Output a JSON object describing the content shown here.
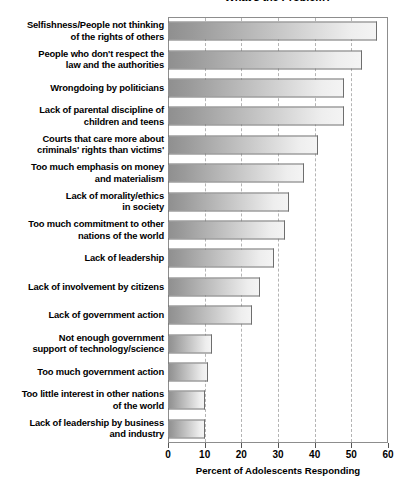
{
  "chart_data": {
    "type": "bar",
    "orientation": "horizontal",
    "title": "What's the Problem?",
    "xlabel": "Percent of Adolescents Responding",
    "ylabel": "",
    "xlim": [
      0,
      60
    ],
    "xticks": [
      0,
      10,
      20,
      30,
      40,
      50,
      60
    ],
    "xtick_labels": [
      "0",
      "10",
      "20",
      "30",
      "40",
      "50",
      "60"
    ],
    "grid": true,
    "grid_axis": "x",
    "grid_style": "dashed",
    "legend": false,
    "categories": [
      "Selfishness/People not thinking of the rights of others",
      "People who don't respect the law and the authorities",
      "Wrongdoing by politicians",
      "Lack of parental discipline of children and teens",
      "Courts that care more about criminals' rights than victims'",
      "Too much emphasis on money and materialism",
      "Lack of morality/ethics in society",
      "Too much commitment to other nations of the world",
      "Lack of leadership",
      "Lack of involvement by citizens",
      "Lack of government action",
      "Not enough government support of technology/science",
      "Too much government action",
      "Too little interest in other nations of the world",
      "Lack of leadership by business and industry"
    ],
    "category_lines": [
      [
        "Selfishness/People not thinking",
        "of the rights of others"
      ],
      [
        "People who don't respect the",
        "law and the authorities"
      ],
      [
        "Wrongdoing by politicians"
      ],
      [
        "Lack of parental discipline of",
        "children and teens"
      ],
      [
        "Courts that care more about",
        "criminals' rights than victims'"
      ],
      [
        "Too much emphasis on money",
        "and materialism"
      ],
      [
        "Lack of morality/ethics",
        "in society"
      ],
      [
        "Too much commitment to other",
        "nations of the world"
      ],
      [
        "Lack of leadership"
      ],
      [
        "Lack of involvement by citizens"
      ],
      [
        "Lack of government action"
      ],
      [
        "Not enough government",
        "support of technology/science"
      ],
      [
        "Too much government action"
      ],
      [
        "Too little interest in other nations",
        "of the world"
      ],
      [
        "Lack of leadership by business",
        "and industry"
      ]
    ],
    "values": [
      57,
      53,
      48,
      48,
      41,
      37,
      33,
      32,
      29,
      25,
      23,
      12,
      11,
      10,
      10
    ],
    "bar_fill_start": "#8f8f8f",
    "bar_fill_end": "#f4f4f4",
    "bar_border": "#6e6e6e",
    "frame_color": "#8d8d8d",
    "grid_color": "#b4b4b4"
  }
}
